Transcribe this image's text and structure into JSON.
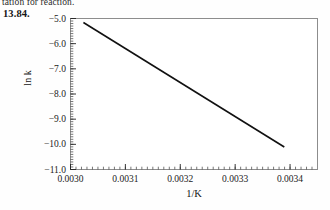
{
  "page": {
    "header_fragment": "tation for reaction.",
    "problem_number": "13.84."
  },
  "chart_data": {
    "type": "line",
    "title": "",
    "subtitle": "",
    "xlabel": "1/K",
    "ylabel": "ln k",
    "xlim": [
      0.003,
      0.00345
    ],
    "ylim": [
      -11.0,
      -5.0
    ],
    "xticks": [
      0.003,
      0.0031,
      0.0032,
      0.0033,
      0.0034
    ],
    "xtick_labels": [
      "0.0030",
      "0.0031",
      "0.0032",
      "0.0033",
      "0.0034"
    ],
    "yticks": [
      -5.0,
      -6.0,
      -7.0,
      -8.0,
      -9.0,
      -10.0,
      -11.0
    ],
    "ytick_labels": [
      "−5.0",
      "−6.0",
      "−7.0",
      "−8.0",
      "−9.0",
      "−10.0",
      "−11.0"
    ],
    "minor_ticks_per_interval": 10,
    "tick_direction": "in",
    "grid": false,
    "legend": false,
    "frame": true,
    "series": [
      {
        "name": "ln k vs 1/K",
        "color": "#111111",
        "linewidth": 1.6,
        "x": [
          0.0030235,
          0.0033895
        ],
        "y": [
          -5.158,
          -10.105
        ],
        "markers": false
      }
    ],
    "annotations": []
  },
  "colors": {
    "line": "#111111",
    "frame": "#8d8d8d",
    "tick": "#3a3a3a",
    "text": "#1a1a1a",
    "background": "#fefefe"
  }
}
